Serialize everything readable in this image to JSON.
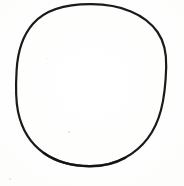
{
  "image": {
    "width": 184,
    "height": 186,
    "background_color": "#fdfdfc",
    "media": "scanned line drawing",
    "description": "A single hand-drawn black circle outline on a blank white background",
    "text_content": "",
    "label_count": 0
  },
  "figure": {
    "shape_name": "circle",
    "stroke_color": "#1a1a1a",
    "fill_color": "none",
    "stroke_width_px": 2.2,
    "center_x": 91,
    "center_y": 85,
    "radius_x": 75,
    "radius_y": 81,
    "bounds": {
      "left": 16,
      "top": 4,
      "right": 166,
      "bottom": 166
    }
  },
  "artifacts": {
    "specks": [
      {
        "x": 68,
        "y": 131,
        "size": 2,
        "color": "#dcdcda"
      },
      {
        "x": 9,
        "y": 178,
        "size": 2,
        "color": "#e2e2e0"
      },
      {
        "x": 47,
        "y": 58,
        "size": 1,
        "color": "#e6e6e4"
      }
    ]
  }
}
